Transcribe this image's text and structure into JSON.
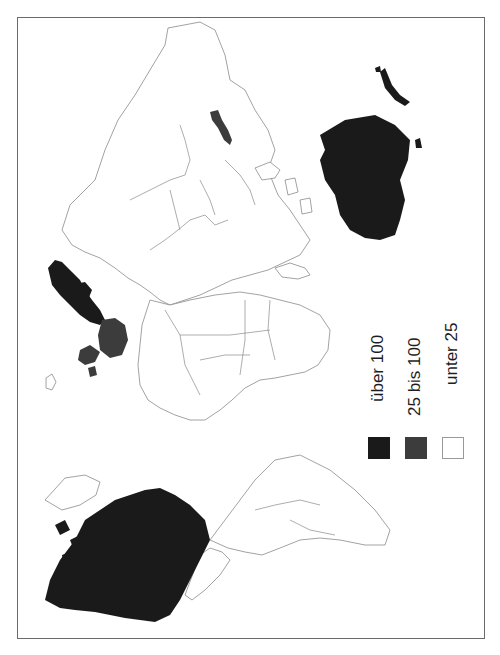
{
  "map": {
    "orientation": "rotated-90-clockwise",
    "colors": {
      "high": "#1a1a1a",
      "mid": "#3c3c3c",
      "low": "#ffffff",
      "outline": "#8a8a8a",
      "frame": "#6a6a6a"
    },
    "regions_high": [
      "North America (USA, Canada)",
      "Australia",
      "New Zealand",
      "Scandinavia (Norway, Sweden, Finland)"
    ],
    "regions_mid": [
      "France",
      "United Kingdom",
      "Ireland",
      "Japan"
    ]
  },
  "legend": {
    "items": [
      {
        "label": "über 100",
        "color": "#1a1a1a"
      },
      {
        "label": "25 bis 100",
        "color": "#3c3c3c"
      },
      {
        "label": "unter 25",
        "color": "#ffffff"
      }
    ]
  }
}
